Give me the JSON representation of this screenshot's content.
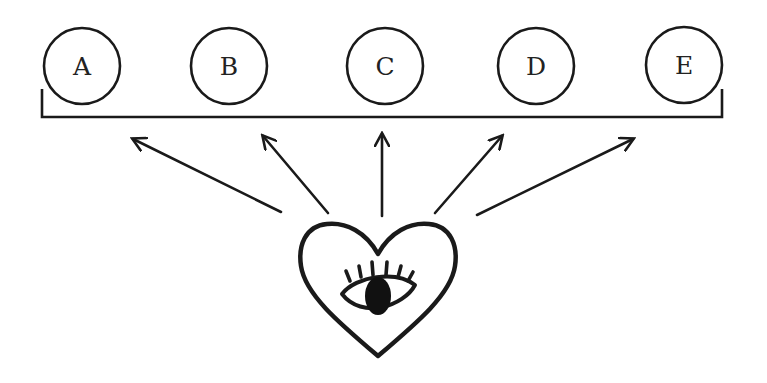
{
  "diagram": {
    "stroke_color": "#1a1a1a",
    "fill_color": "#ffffff",
    "nodes": [
      {
        "label": "A",
        "cx": 82,
        "cy": 66,
        "r": 38
      },
      {
        "label": "B",
        "cx": 229,
        "cy": 66,
        "r": 38
      },
      {
        "label": "C",
        "cx": 385,
        "cy": 66,
        "r": 38
      },
      {
        "label": "D",
        "cx": 536,
        "cy": 66,
        "r": 38
      },
      {
        "label": "E",
        "cx": 684,
        "cy": 65,
        "r": 38
      }
    ],
    "bracket": {
      "left": 42,
      "right": 722,
      "top": 89,
      "bottom": 117
    },
    "arrows": [
      {
        "target": "A",
        "x1": 281,
        "y1": 212,
        "x2": 133,
        "y2": 139
      },
      {
        "target": "B",
        "x1": 328,
        "y1": 213,
        "x2": 263,
        "y2": 136
      },
      {
        "target": "C",
        "x1": 382,
        "y1": 216,
        "x2": 382,
        "y2": 134
      },
      {
        "target": "D",
        "x1": 435,
        "y1": 213,
        "x2": 502,
        "y2": 136
      },
      {
        "target": "E",
        "x1": 477,
        "y1": 215,
        "x2": 633,
        "y2": 139
      }
    ],
    "source_icon": "heart-with-eye-icon"
  }
}
